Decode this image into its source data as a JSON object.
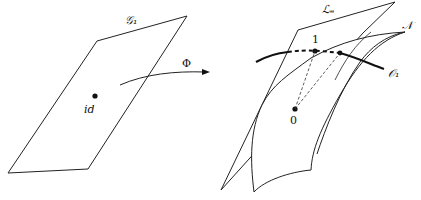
{
  "diagram": {
    "left_plane": {
      "label": "𝒢₁",
      "point_label": "id"
    },
    "map": {
      "label": "Φ"
    },
    "right": {
      "plane_label": "ℒₑ",
      "surface_label": "𝒩",
      "orbit_label": "𝒪₁",
      "point_1_label": "1",
      "origin_label": "0"
    },
    "colors": {
      "stroke": "#222222",
      "background": "#ffffff"
    }
  }
}
